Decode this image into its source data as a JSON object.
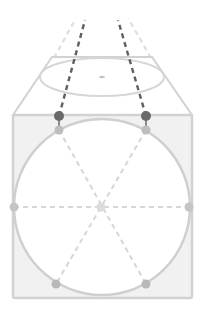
{
  "diagram": {
    "colors": {
      "background": "#ffffff",
      "box_fill": "#f1f1f1",
      "outline": "#d2d2d2",
      "circle_stroke": "#cfcfcf",
      "circle_fill": "#ffffff",
      "guide_dash": "#d6d6d6",
      "dark_dash": "#5f5f5f",
      "light_dash": "#dedede",
      "dark_dot": "#6a6a6a",
      "mid_dot": "#bdbdbd",
      "center_dot": "#dcdcdc"
    },
    "top_face": {
      "top_y": 57,
      "top_x1": 52,
      "top_x2": 152,
      "bottom_y": 115,
      "bottom_x1": 13,
      "bottom_x2": 192
    },
    "top_ellipse": {
      "cx": 102,
      "cy": 77,
      "rx": 62,
      "ry": 19
    },
    "front_box": {
      "x": 13,
      "y": 115,
      "w": 179,
      "h": 183
    },
    "circle": {
      "cx": 102,
      "cy": 207,
      "r": 88
    },
    "points": {
      "dark_left": [
        59,
        116
      ],
      "dark_right": [
        146,
        116
      ],
      "top_left": [
        59,
        130
      ],
      "top_right": [
        146,
        130
      ],
      "mid_left": [
        14,
        207
      ],
      "mid_right": [
        189,
        207
      ],
      "center": [
        101,
        207
      ],
      "bottom_left": [
        56,
        284
      ],
      "bottom_right": [
        146,
        284
      ]
    }
  }
}
